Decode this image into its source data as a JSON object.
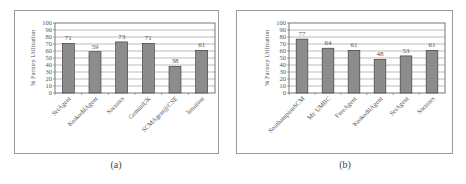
{
  "chart_data": [
    {
      "type": "bar",
      "title": "",
      "caption": "(a)",
      "xlabel": "",
      "ylabel": "% Factory Utilization",
      "ylim": [
        0,
        100
      ],
      "yticks": [
        0,
        10,
        20,
        30,
        40,
        50,
        60,
        70,
        80,
        90,
        100
      ],
      "grid": true,
      "legend": "none",
      "categories": [
        "SetAgent",
        "KrokodilAgent",
        "Socrates",
        "GeminiUK",
        "SCMAgent@CSE",
        "Intuition"
      ],
      "values": [
        71,
        59,
        73,
        71,
        38,
        61
      ],
      "bar_color": "#8c8c8c"
    },
    {
      "type": "bar",
      "title": "",
      "caption": "(b)",
      "xlabel": "",
      "ylabel": "% Factory Utilization",
      "ylim": [
        0,
        100
      ],
      "yticks": [
        0,
        10,
        20,
        30,
        40,
        50,
        60,
        70,
        80,
        90,
        100
      ],
      "grid": true,
      "legend": "none",
      "categories": [
        "SouthamptonSCM",
        "Mr. UMBC",
        "FreeAgent",
        "KrokodilAgent",
        "SetAgent",
        "Socrates"
      ],
      "values": [
        77,
        64,
        61,
        48,
        53,
        61
      ],
      "bar_color": "#8c8c8c"
    }
  ]
}
